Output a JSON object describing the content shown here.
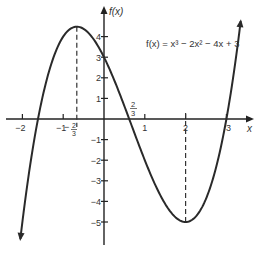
{
  "chart_data": {
    "type": "line",
    "title": "",
    "xlabel": "x",
    "ylabel": "f(x)",
    "function_label": "f(x) = x³ − 2x² − 4x + 3",
    "function_expr": "x^3 - 2x^2 - 4x + 3",
    "xlim": [
      -2.4,
      3.6
    ],
    "ylim": [
      -6,
      5.5
    ],
    "x_ticks": [
      {
        "value": -2,
        "label": "−2"
      },
      {
        "value": -1,
        "label": "−1"
      },
      {
        "value": 1,
        "label": "1"
      },
      {
        "value": 2,
        "label": "2"
      },
      {
        "value": 3,
        "label": "3"
      }
    ],
    "y_ticks": [
      {
        "value": 4,
        "label": "4"
      },
      {
        "value": 3,
        "label": "3"
      },
      {
        "value": 2,
        "label": "2"
      },
      {
        "value": 1,
        "label": "1"
      },
      {
        "value": -1,
        "label": "−1"
      },
      {
        "value": -2,
        "label": "−2"
      },
      {
        "value": -3,
        "label": "−3"
      },
      {
        "value": -4,
        "label": "−4"
      },
      {
        "value": -5,
        "label": "−5"
      }
    ],
    "annotations": [
      {
        "x": -0.6667,
        "label": "−2/3",
        "type": "local-maximum",
        "y": 4.48
      },
      {
        "x": 2,
        "label": "",
        "type": "local-minimum",
        "y": -5
      },
      {
        "x": 0.6667,
        "label": "2/3",
        "type": "root",
        "y": 0
      },
      {
        "x": 3,
        "label": "3",
        "type": "root",
        "y": 0
      }
    ],
    "key_points": [
      {
        "x": -1.56,
        "y": 0
      },
      {
        "x": -0.6667,
        "y": 4.48
      },
      {
        "x": 0,
        "y": 3
      },
      {
        "x": 0.6667,
        "y": 0
      },
      {
        "x": 2,
        "y": -5
      },
      {
        "x": 3,
        "y": 0
      }
    ],
    "curve_domain": [
      -2.05,
      3.35
    ],
    "grid": false,
    "legend": null
  },
  "labels": {
    "y_axis": "f(x)",
    "x_axis": "x",
    "equation": "f(x) = x³ − 2x² − 4x + 3",
    "max_x_num": "2",
    "max_x_den": "3",
    "root_num": "2",
    "root_den": "3"
  }
}
